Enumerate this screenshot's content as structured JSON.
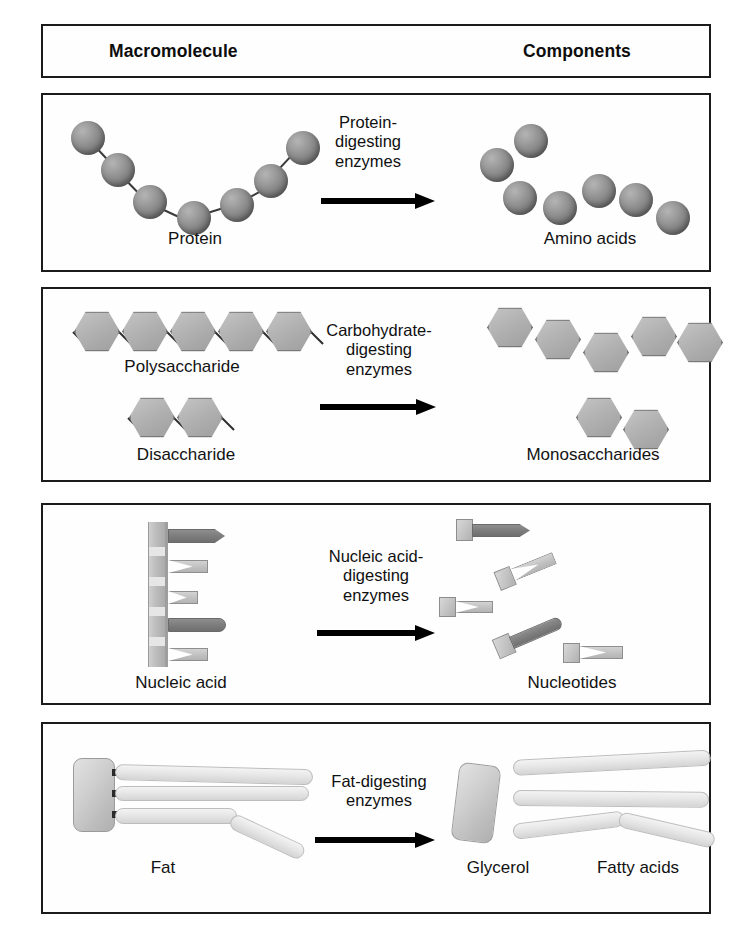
{
  "diagram": {
    "header": {
      "left_label": "Macromolecule",
      "right_label": "Components"
    },
    "rows": [
      {
        "id": "protein",
        "reactant_label": "Protein",
        "enzyme_lines": [
          "Protein-",
          "digesting",
          "enzymes"
        ],
        "product_label": "Amino acids",
        "reactant_unit_count": 7,
        "product_unit_count": 7,
        "unit_shape": "sphere"
      },
      {
        "id": "carbohydrate",
        "reactant_label": "Polysaccharide",
        "reactant_label_2": "Disaccharide",
        "enzyme_lines": [
          "Carbohydrate-",
          "digesting",
          "enzymes"
        ],
        "product_label": "Monosaccharides",
        "reactant_unit_count": 5,
        "reactant_unit_count_2": 2,
        "product_unit_count": 7,
        "unit_shape": "hexagon"
      },
      {
        "id": "nucleic-acid",
        "reactant_label": "Nucleic acid",
        "enzyme_lines": [
          "Nucleic acid-",
          "digesting",
          "enzymes"
        ],
        "product_label": "Nucleotides",
        "reactant_unit_count": 5,
        "product_unit_count": 5,
        "unit_shape": "nucleotide"
      },
      {
        "id": "fat",
        "reactant_label": "Fat",
        "enzyme_lines": [
          "Fat-digesting",
          "enzymes"
        ],
        "product_label": "Glycerol",
        "product_label_2": "Fatty acids",
        "reactant_unit_count": 3,
        "product_unit_count": 3,
        "unit_shape": "chain"
      }
    ],
    "colors": {
      "border": "#1b1b1b",
      "arrow": "#000000",
      "sphere": "#8a8a8a",
      "hexagon": "#b2b2b2",
      "nucleotide": "#c3c3c3",
      "fat_chain": "#e6e6e6",
      "text": "#111111",
      "background": "#ffffff"
    }
  }
}
